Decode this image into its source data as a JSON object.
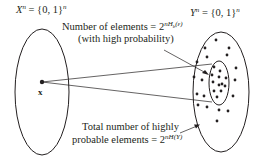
{
  "diagram": {
    "left_set": {
      "label_symbol": "X",
      "label_sup": "n",
      "label_rest": " = {0, 1}",
      "label_rest_sup": "n",
      "point_label": "x"
    },
    "right_set": {
      "label_symbol": "Y",
      "label_sup": "n",
      "label_rest": " = {0, 1}",
      "label_rest_sup": "n"
    },
    "annotation_top": {
      "line1_text": "Number of elements = 2",
      "line1_exponent": "nH",
      "line1_exponent_sub": "b",
      "line1_exponent_arg": "(ε)",
      "line2_text": "(with high probability)"
    },
    "annotation_bottom": {
      "line1_text": "Total number of highly",
      "line2_text": "probable elements = 2",
      "line2_exponent": "nH(Y)"
    },
    "colors": {
      "ink": "#231f20",
      "background": "#ffffff"
    }
  }
}
